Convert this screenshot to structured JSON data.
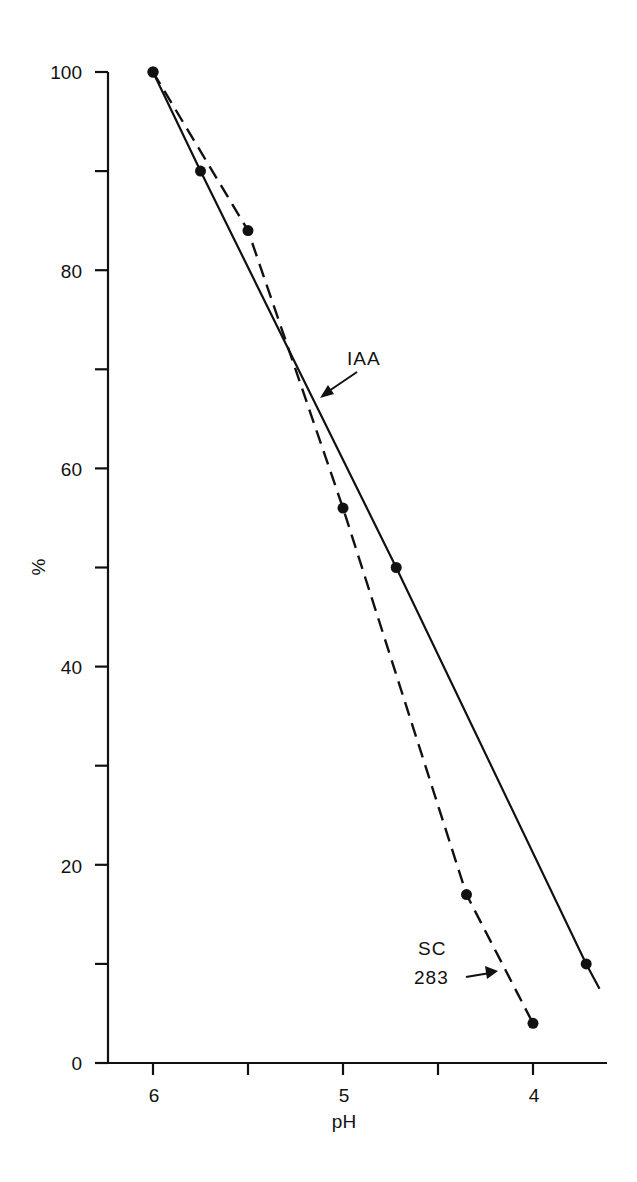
{
  "chart_data": {
    "type": "line",
    "title": "",
    "xlabel": "pH",
    "ylabel": "%",
    "xlim": [
      6.25,
      3.55
    ],
    "ylim": [
      0,
      100
    ],
    "x_reversed": true,
    "grid": false,
    "legend": "none (inline annotations with arrows)",
    "x_ticks": [
      6,
      5.5,
      5,
      4.5,
      4
    ],
    "x_tick_labels": [
      "6",
      "",
      "5",
      "",
      "4"
    ],
    "y_ticks": [
      0,
      10,
      20,
      30,
      40,
      50,
      60,
      70,
      80,
      90,
      100
    ],
    "y_tick_labels": [
      "0",
      "",
      "20",
      "",
      "40",
      "",
      "60",
      "",
      "80",
      "",
      "100"
    ],
    "series": [
      {
        "name": "IAA",
        "style": "solid",
        "marker": "filled-circle",
        "points": [
          {
            "x": 6.0,
            "y": 100
          },
          {
            "x": 5.75,
            "y": 90
          },
          {
            "x": 4.72,
            "y": 50
          },
          {
            "x": 3.72,
            "y": 10
          }
        ],
        "line_extends_to": {
          "x": 3.65,
          "y": 7.5
        }
      },
      {
        "name": "SC 283",
        "style": "dashed",
        "marker": "filled-circle",
        "points": [
          {
            "x": 6.0,
            "y": 100
          },
          {
            "x": 5.5,
            "y": 84
          },
          {
            "x": 5.0,
            "y": 56
          },
          {
            "x": 4.35,
            "y": 17
          },
          {
            "x": 4.0,
            "y": 4
          }
        ]
      }
    ],
    "annotations": [
      {
        "text": "IAA",
        "target_series": "IAA",
        "arrow": true
      },
      {
        "text": "SC\n283",
        "target_series": "SC 283",
        "arrow": true
      }
    ]
  },
  "labels": {
    "x_axis_title": "pH",
    "y_axis_title": "%",
    "annotation_iaa": "IAA",
    "annotation_sc_line1": "SC",
    "annotation_sc_line2": "283",
    "x_tick_6": "6",
    "x_tick_5": "5",
    "x_tick_4": "4",
    "y_tick_0": "0",
    "y_tick_20": "20",
    "y_tick_40": "40",
    "y_tick_60": "60",
    "y_tick_80": "80",
    "y_tick_100": "100"
  },
  "colors": {
    "ink": "#111111",
    "background": "#ffffff"
  }
}
